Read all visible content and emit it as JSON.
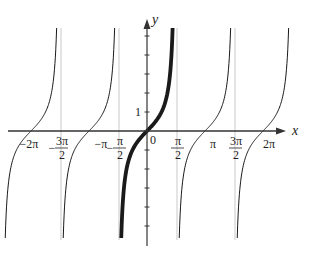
{
  "figure": {
    "function": "tan x",
    "highlighted_branch": {
      "from": "-π/2",
      "to": "π/2"
    },
    "axes": {
      "x_label": "x",
      "y_label": "y",
      "origin_label": "0",
      "y_tick_label": "1"
    },
    "x_ticks": [
      {
        "value": -6.2832,
        "num": "−2π",
        "den": ""
      },
      {
        "value": -4.7124,
        "num": "3π",
        "den": "2",
        "neg": "−"
      },
      {
        "value": -3.1416,
        "num": "−π",
        "den": ""
      },
      {
        "value": -1.5708,
        "num": "π",
        "den": "2",
        "neg": "−"
      },
      {
        "value": 1.5708,
        "num": "π",
        "den": "2",
        "neg": ""
      },
      {
        "value": 3.1416,
        "num": "π",
        "den": ""
      },
      {
        "value": 4.7124,
        "num": "3π",
        "den": "2",
        "neg": ""
      },
      {
        "value": 6.2832,
        "num": "2π",
        "den": ""
      }
    ],
    "asymptotes": [
      -4.7124,
      -1.5708,
      1.5708,
      4.7124
    ],
    "branches": [
      {
        "center": -6.2832,
        "bold": false
      },
      {
        "center": -3.1416,
        "bold": false
      },
      {
        "center": 0,
        "bold": true
      },
      {
        "center": 3.1416,
        "bold": false
      },
      {
        "center": 6.2832,
        "bold": false
      }
    ],
    "x_range": [
      -6.9,
      8.5
    ],
    "y_range": [
      -6.0,
      6.0
    ]
  },
  "colors": {
    "curve": "#1a1a1a",
    "axis": "#333333",
    "asymptote": "#bbbbbb"
  }
}
